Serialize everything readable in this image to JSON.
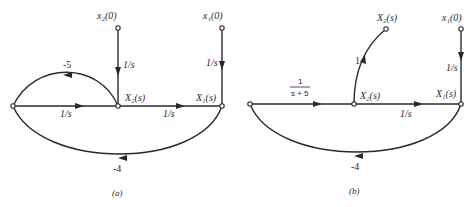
{
  "diagrams": [
    {
      "id": "a",
      "caption": "(a)",
      "nodes": {
        "left": {
          "label": ""
        },
        "x2_node": {
          "label": "X₂(s)"
        },
        "x1_node": {
          "label": "X₁(s)"
        },
        "x2_init": {
          "label": "x₂(0)"
        },
        "x1_init": {
          "label": "x₁(0)"
        }
      },
      "edges": {
        "left_to_x2": "1/s",
        "x2_to_x1": "1/s",
        "x2init_to_x2": "1/s",
        "x1init_to_x1": "1/s",
        "feedback_x2_to_left": "-5",
        "feedback_x1_to_left": "-4"
      }
    },
    {
      "id": "b",
      "caption": "(b)",
      "nodes": {
        "left": {
          "label": ""
        },
        "x2_node": {
          "label": "X₂(s)"
        },
        "x1_node": {
          "label": "X₁(s)"
        },
        "x2_out": {
          "label": "X₂(s)"
        },
        "x1_init": {
          "label": "x₁(0)"
        }
      },
      "edges": {
        "left_to_x2_num": "1",
        "left_to_x2_den": "s + 5",
        "x2_to_x1": "1/s",
        "x2_to_out": "1",
        "x1init_to_x1": "1/s",
        "feedback_x1_to_left": "-4"
      }
    }
  ]
}
